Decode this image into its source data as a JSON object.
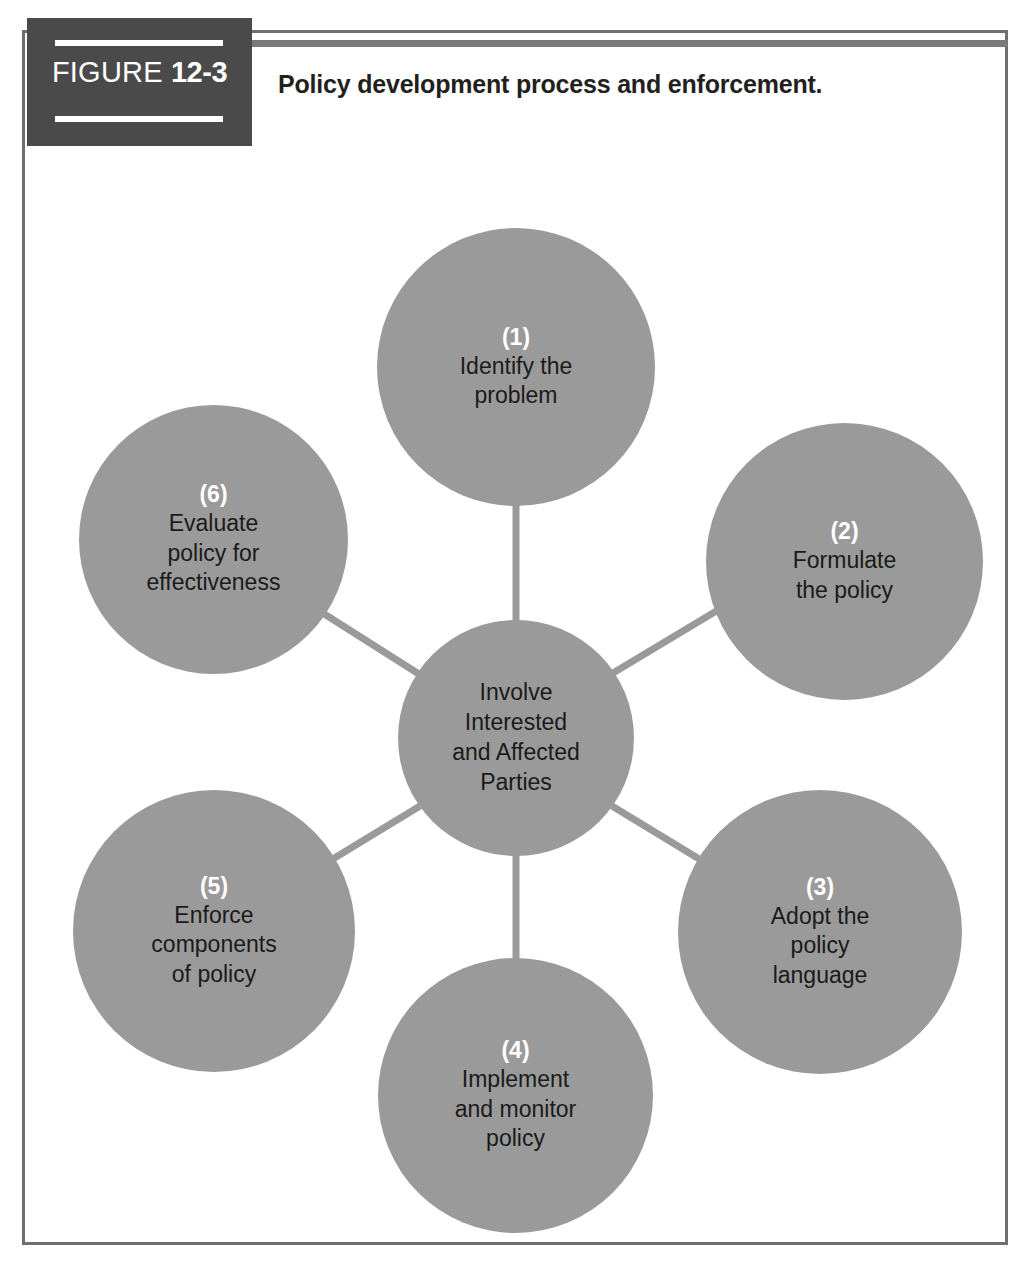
{
  "figure": {
    "label_word": "FIGURE",
    "label_number": "12-3",
    "title": "Policy development process and enforcement."
  },
  "colors": {
    "node_fill": "#9a9a9a",
    "label_box": "#4a4a4a",
    "frame": "#6f6f6f",
    "step_label_text": "#ffffff",
    "node_body_text": "#1a1a1a",
    "background": "#ffffff"
  },
  "diagram": {
    "type": "hub-and-spoke cycle",
    "center": {
      "text": "Involve\nInterested\nand Affected\nParties"
    },
    "steps": [
      {
        "step": "(1)",
        "text": "Identify the\nproblem"
      },
      {
        "step": "(2)",
        "text": "Formulate\nthe policy"
      },
      {
        "step": "(3)",
        "text": "Adopt the\npolicy\nlanguage"
      },
      {
        "step": "(4)",
        "text": "Implement\nand monitor\npolicy"
      },
      {
        "step": "(5)",
        "text": "Enforce\ncomponents\nof policy"
      },
      {
        "step": "(6)",
        "text": "Evaluate\npolicy for\neffectiveness"
      }
    ]
  }
}
